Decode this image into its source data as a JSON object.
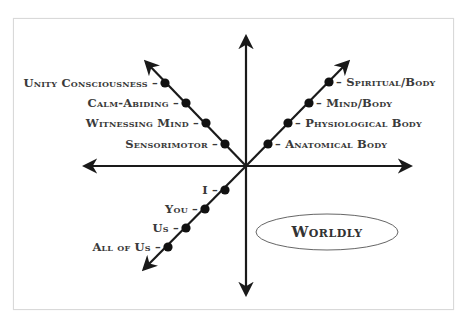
{
  "diagram": {
    "title": "",
    "line_color": "#1a1a1a",
    "dot_color": "#111111",
    "upper_left_axis": {
      "labels": [
        "Unity Consciousness",
        "Calm-Abiding",
        "Witnessing Mind",
        "Sensorimotor"
      ]
    },
    "upper_right_axis": {
      "labels": [
        "Spiritual/Body",
        "Mind/Body",
        "Physiological Body",
        "Anatomical Body"
      ]
    },
    "lower_left_axis": {
      "labels": [
        "I",
        "You",
        "Us",
        "All of Us"
      ]
    },
    "dash": "–",
    "quadrant_label": "Worldly"
  }
}
